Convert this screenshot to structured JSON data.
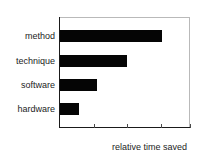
{
  "chart_data": {
    "type": "bar",
    "orientation": "horizontal",
    "title": "",
    "xlabel": "relative time saved",
    "ylabel": "",
    "categories": [
      "method",
      "technique",
      "software",
      "hardware"
    ],
    "values": [
      100,
      66,
      36,
      19
    ],
    "xlim": [
      0,
      128
    ],
    "ylim": null,
    "grid": false,
    "legend": null,
    "xticks": [
      "",
      "",
      "",
      ""
    ],
    "xtick_positions": [
      33,
      66,
      99,
      128
    ],
    "bar_color": "#050505",
    "frame_color": "#b9b9b9",
    "axis_color": "#1a1a1a",
    "text_color": "#1c1c1c",
    "background": "#ffffff"
  },
  "labels": {
    "cat0": "method",
    "cat1": "technique",
    "cat2": "software",
    "cat3": "hardware",
    "xaxis_caption": "relative time saved"
  }
}
